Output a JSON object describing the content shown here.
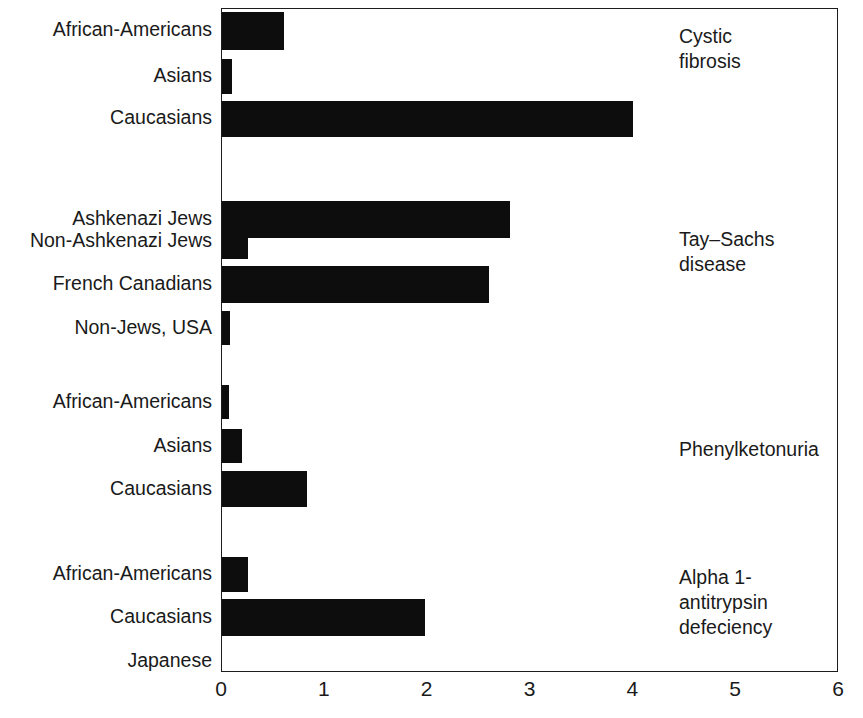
{
  "chart_data": {
    "type": "bar",
    "orientation": "horizontal",
    "title": "",
    "subtitle": "",
    "xlabel": "",
    "ylabel": "",
    "xlim": [
      0,
      6
    ],
    "xticks": [
      0,
      1,
      2,
      3,
      4,
      5,
      6
    ],
    "xtick_labels": [
      "0",
      "1",
      "2",
      "3",
      "4",
      "5",
      "6"
    ],
    "grid": false,
    "legend": false,
    "bar_color": "#0d0d0d",
    "axis_color": "#1c1c1c",
    "background_color": "#ffffff",
    "groups": [
      {
        "name": "Cystic fibrosis",
        "label": "Cystic\nfibrosis",
        "categories": [
          "African-Americans",
          "Asians",
          "Caucasians"
        ],
        "values": [
          0.6,
          0.1,
          4.0
        ]
      },
      {
        "name": "Tay-Sachs disease",
        "label": "Tay–Sachs\ndisease",
        "categories": [
          "Ashkenazi Jews",
          "Non-Ashkenazi Jews",
          "French Canadians",
          "Non-Jews, USA"
        ],
        "values": [
          2.8,
          0.25,
          2.6,
          0.08
        ]
      },
      {
        "name": "Phenylketonuria",
        "label": "Phenylketonuria",
        "categories": [
          "African-Americans",
          "Asians",
          "Caucasians"
        ],
        "values": [
          0.07,
          0.19,
          0.83
        ]
      },
      {
        "name": "Alpha 1-antitrypsin defeciency",
        "label": "Alpha 1-\nantitrypsin\ndefeciency",
        "categories": [
          "African-Americans",
          "Caucasians",
          "Japanese"
        ],
        "values": [
          0.25,
          1.97,
          0.0
        ]
      }
    ],
    "categories": [
      "African-Americans",
      "Asians",
      "Caucasians",
      "Ashkenazi Jews",
      "Non-Ashkenazi Jews",
      "French Canadians",
      "Non-Jews, USA",
      "African-Americans",
      "Asians",
      "Caucasians",
      "African-Americans",
      "Caucasians",
      "Japanese"
    ],
    "values": [
      0.6,
      0.1,
      4.0,
      2.8,
      0.25,
      2.6,
      0.08,
      0.07,
      0.19,
      0.83,
      0.25,
      1.97,
      0.0
    ]
  },
  "bars": [
    {
      "label": "African-Americans",
      "value": 0.6,
      "group": "Cystic fibrosis",
      "top": 11,
      "height": 38
    },
    {
      "label": "Asians",
      "value": 0.1,
      "group": "Cystic fibrosis",
      "top": 58,
      "height": 35
    },
    {
      "label": "Caucasians",
      "value": 4.0,
      "group": "Cystic fibrosis",
      "top": 100,
      "height": 36
    },
    {
      "label": "Ashkenazi Jews",
      "value": 2.8,
      "group": "Tay–Sachs disease",
      "top": 200,
      "height": 37
    },
    {
      "label": "Non-Ashkenazi Jews",
      "value": 0.25,
      "group": "Tay–Sachs disease",
      "top": 222,
      "height": 36
    },
    {
      "label": "French Canadians",
      "value": 2.6,
      "group": "Tay–Sachs disease",
      "top": 265,
      "height": 37
    },
    {
      "label": "Non-Jews, USA",
      "value": 0.08,
      "group": "Tay–Sachs disease",
      "top": 310,
      "height": 34
    },
    {
      "label": "African-Americans",
      "value": 0.07,
      "group": "Phenylketonuria",
      "top": 384,
      "height": 34
    },
    {
      "label": "Asians",
      "value": 0.19,
      "group": "Phenylketonuria",
      "top": 428,
      "height": 34
    },
    {
      "label": "Caucasians",
      "value": 0.83,
      "group": "Phenylketonuria",
      "top": 470,
      "height": 36
    },
    {
      "label": "African-Americans",
      "value": 0.25,
      "group": "Alpha 1-antitrypsin defeciency",
      "top": 556,
      "height": 35
    },
    {
      "label": "Caucasians",
      "value": 1.97,
      "group": "Alpha 1-antitrypsin defeciency",
      "top": 598,
      "height": 37
    },
    {
      "label": "Japanese",
      "value": 0.0,
      "group": "Alpha 1-antitrypsin defeciency",
      "top": 643,
      "height": 34
    }
  ],
  "category_labels": [
    {
      "text": "African-Americans",
      "top": 20
    },
    {
      "text": "Asians",
      "top": 66
    },
    {
      "text": "Caucasians",
      "top": 108
    },
    {
      "text": "Ashkenazi Jews",
      "top": 209
    },
    {
      "text": "Non-Ashkenazi Jews",
      "top": 231
    },
    {
      "text": "French Canadians",
      "top": 274
    },
    {
      "text": "Non-Jews, USA",
      "top": 318
    },
    {
      "text": "African-Americans",
      "top": 392
    },
    {
      "text": "Asians",
      "top": 436
    },
    {
      "text": "Caucasians",
      "top": 479
    },
    {
      "text": "African-Americans",
      "top": 564
    },
    {
      "text": "Caucasians",
      "top": 607
    },
    {
      "text": "Japanese",
      "top": 651
    }
  ],
  "group_labels": [
    {
      "text": "Cystic\nfibrosis",
      "top": 24
    },
    {
      "text": "Tay–Sachs\ndisease",
      "top": 227
    },
    {
      "text": "Phenylketonuria",
      "top": 437
    },
    {
      "text": "Alpha 1-\nantitrypsin\ndefeciency",
      "top": 565
    }
  ],
  "x_ticks": [
    {
      "label": "0",
      "value": 0
    },
    {
      "label": "1",
      "value": 1
    },
    {
      "label": "2",
      "value": 2
    },
    {
      "label": "3",
      "value": 3
    },
    {
      "label": "4",
      "value": 4
    },
    {
      "label": "5",
      "value": 5
    },
    {
      "label": "6",
      "value": 6
    }
  ],
  "geometry": {
    "plot_left": 221,
    "plot_top": 8,
    "plot_width": 617,
    "plot_height": 664,
    "px_per_unit": 102.83
  }
}
